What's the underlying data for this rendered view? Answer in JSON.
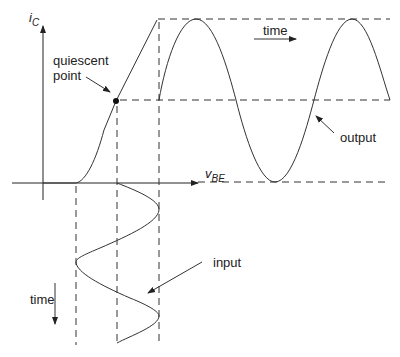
{
  "diagram": {
    "axes": {
      "y_label_main": "i",
      "y_label_sub": "C",
      "x_label_main": "v",
      "x_label_sub": "BE"
    },
    "labels": {
      "quiescent": [
        "quiescent",
        "point"
      ],
      "time_top": "time",
      "time_left": "time",
      "output": "output",
      "input": "input"
    },
    "colors": {
      "line": "#333333",
      "background": "#ffffff"
    }
  }
}
